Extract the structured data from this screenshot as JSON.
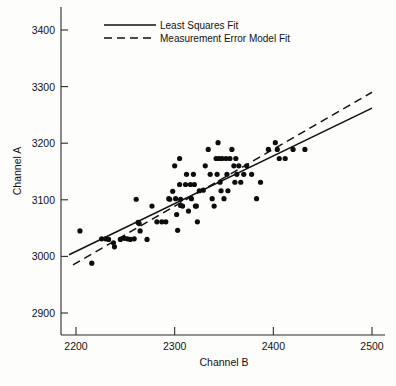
{
  "chart_data": {
    "type": "scatter",
    "title": "",
    "xlabel": "Channel B",
    "ylabel": "Channel A",
    "xlim": [
      2190,
      2500
    ],
    "ylim": [
      2870,
      3415
    ],
    "xticks": [
      2200,
      2300,
      2400,
      2500
    ],
    "xticklabels": [
      "2200",
      "2300",
      "2400",
      "2500"
    ],
    "yticks": [
      2900,
      3000,
      3100,
      3200,
      3300,
      3400
    ],
    "yticklabels": [
      "2900",
      "3000",
      "3100",
      "3200",
      "3300",
      "3400"
    ],
    "grid": false,
    "legend_position": "top-center",
    "marker": "filled-circle",
    "marker_color": "#0d0d0d",
    "points": [
      [
        2204,
        3045
      ],
      [
        2216,
        2988
      ],
      [
        2226,
        3031
      ],
      [
        2230,
        3031
      ],
      [
        2233,
        3030
      ],
      [
        2238,
        3024
      ],
      [
        2239,
        3017
      ],
      [
        2245,
        3030
      ],
      [
        2249,
        3032
      ],
      [
        2252,
        3031
      ],
      [
        2255,
        3030
      ],
      [
        2259,
        3031
      ],
      [
        2261,
        3101
      ],
      [
        2263,
        3060
      ],
      [
        2264,
        3058
      ],
      [
        2265,
        3045
      ],
      [
        2272,
        3030
      ],
      [
        2277,
        3089
      ],
      [
        2282,
        3061
      ],
      [
        2287,
        3061
      ],
      [
        2291,
        3061
      ],
      [
        2294,
        3102
      ],
      [
        2295,
        3101
      ],
      [
        2298,
        3115
      ],
      [
        2300,
        3160
      ],
      [
        2301,
        3102
      ],
      [
        2302,
        3074
      ],
      [
        2303,
        3046
      ],
      [
        2305,
        3173
      ],
      [
        2305,
        3127
      ],
      [
        2306,
        3101
      ],
      [
        2306,
        3090
      ],
      [
        2308,
        3089
      ],
      [
        2311,
        3127
      ],
      [
        2312,
        3145
      ],
      [
        2314,
        3080
      ],
      [
        2316,
        3127
      ],
      [
        2317,
        3102
      ],
      [
        2319,
        3145
      ],
      [
        2320,
        3127
      ],
      [
        2321,
        3089
      ],
      [
        2322,
        3089
      ],
      [
        2323,
        3061
      ],
      [
        2325,
        3116
      ],
      [
        2329,
        3117
      ],
      [
        2331,
        3160
      ],
      [
        2334,
        3189
      ],
      [
        2336,
        3145
      ],
      [
        2338,
        3102
      ],
      [
        2340,
        3089
      ],
      [
        2342,
        3173
      ],
      [
        2343,
        3145
      ],
      [
        2344,
        3201
      ],
      [
        2345,
        3173
      ],
      [
        2346,
        3131
      ],
      [
        2347,
        3116
      ],
      [
        2348,
        3173
      ],
      [
        2350,
        3102
      ],
      [
        2352,
        3173
      ],
      [
        2353,
        3145
      ],
      [
        2354,
        3116
      ],
      [
        2356,
        3173
      ],
      [
        2358,
        3189
      ],
      [
        2360,
        3160
      ],
      [
        2361,
        3131
      ],
      [
        2362,
        3173
      ],
      [
        2363,
        3145
      ],
      [
        2365,
        3160
      ],
      [
        2367,
        3131
      ],
      [
        2370,
        3145
      ],
      [
        2373,
        3160
      ],
      [
        2378,
        3145
      ],
      [
        2383,
        3102
      ],
      [
        2387,
        3131
      ],
      [
        2395,
        3189
      ],
      [
        2402,
        3201
      ],
      [
        2404,
        3189
      ],
      [
        2406,
        3173
      ],
      [
        2412,
        3173
      ],
      [
        2420,
        3189
      ],
      [
        2432,
        3189
      ]
    ],
    "series_lines": [
      {
        "name": "Least Squares Fit",
        "style": "solid",
        "x0": 2193,
        "y0": 3003,
        "x1": 2500,
        "y1": 3262
      },
      {
        "name": "Measurement Error Model Fit",
        "style": "dashed",
        "x0": 2197,
        "y0": 2985,
        "x1": 2500,
        "y1": 3290
      }
    ],
    "legend": [
      {
        "label": "Least Squares Fit",
        "style": "solid"
      },
      {
        "label": "Measurement Error Model Fit",
        "style": "dashed"
      }
    ]
  }
}
